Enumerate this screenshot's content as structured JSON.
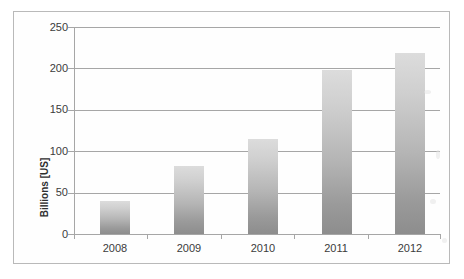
{
  "chart_data": {
    "type": "bar",
    "title": "",
    "subtitle": "",
    "xlabel": "",
    "ylabel": "Billions [US]",
    "categories": [
      "2008",
      "2009",
      "2010",
      "2011",
      "2012"
    ],
    "values": [
      40,
      82,
      115,
      198,
      219
    ],
    "series": [
      {
        "name": "",
        "values": [
          40,
          82,
          115,
          198,
          219
        ]
      }
    ],
    "ylim": [
      0,
      250
    ],
    "y_ticks": [
      0,
      50,
      100,
      150,
      200,
      250
    ],
    "y_tick_labels": [
      "0",
      "50",
      "100",
      "150",
      "200",
      "250"
    ],
    "grid": "horizontal",
    "legend": "none",
    "bar_color_top": "#dcdcdc",
    "bar_color_bottom": "#8d8d8d",
    "gridline_color": "#a6a6a6",
    "axis_color": "#a6a6a6",
    "background": "#ffffff"
  },
  "figure": {
    "frame_color": "#b9b9b9"
  }
}
